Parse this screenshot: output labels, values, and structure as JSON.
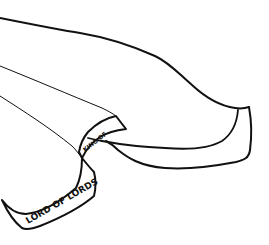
{
  "drawing": {
    "type": "line-art",
    "subject": "draped cloth / sash with banner",
    "colors": {
      "background": "#ffffff",
      "ink": "#111111"
    },
    "banner_lower_text": "LORD OF LORDS",
    "banner_upper_text": "KING OF"
  }
}
